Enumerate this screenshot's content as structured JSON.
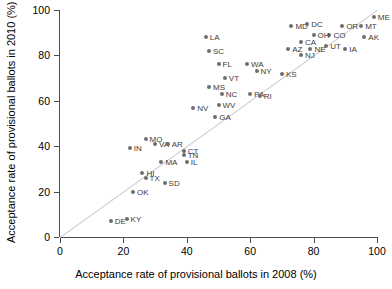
{
  "chart_data": {
    "type": "scatter",
    "title": "",
    "xlabel": "Acceptance rate of provisional ballots in 2008 (%)",
    "ylabel": "Acceptance rate of provisional ballots in 2010 (%)",
    "xlim": [
      0,
      100
    ],
    "ylim": [
      0,
      100
    ],
    "xticks": [
      0,
      20,
      40,
      60,
      80,
      100
    ],
    "yticks": [
      0,
      20,
      40,
      60,
      80,
      100
    ],
    "grid": false,
    "legend": "none",
    "annotations": [
      {
        "label": "reference-line",
        "description": "1:1 identity line y = x",
        "color": "#c8c8c8"
      }
    ],
    "point_color": "#6e6e6e",
    "points": [
      {
        "label": "LA",
        "x": 46,
        "y": 88,
        "label_side": "right"
      },
      {
        "label": "SC",
        "x": 47,
        "y": 82,
        "label_side": "right"
      },
      {
        "label": "MD",
        "x": 73,
        "y": 93,
        "label_side": "right"
      },
      {
        "label": "DC",
        "x": 78,
        "y": 94,
        "label_side": "right"
      },
      {
        "label": "ME",
        "x": 99,
        "y": 97,
        "label_side": "right"
      },
      {
        "label": "MT",
        "x": 95,
        "y": 93,
        "label_side": "right"
      },
      {
        "label": "OR",
        "x": 89,
        "y": 93,
        "label_side": "right"
      },
      {
        "label": "AK",
        "x": 96,
        "y": 88,
        "label_side": "right"
      },
      {
        "label": "CO",
        "x": 85,
        "y": 89,
        "label_side": "right"
      },
      {
        "label": "OH",
        "x": 80,
        "y": 89,
        "label_side": "right"
      },
      {
        "label": "CA",
        "x": 76,
        "y": 86,
        "label_side": "right"
      },
      {
        "label": "UT",
        "x": 84,
        "y": 84,
        "label_side": "right"
      },
      {
        "label": "NE",
        "x": 79,
        "y": 83,
        "label_side": "right"
      },
      {
        "label": "AZ",
        "x": 72,
        "y": 83,
        "label_side": "right"
      },
      {
        "label": "IA",
        "x": 90,
        "y": 83,
        "label_side": "right"
      },
      {
        "label": "NJ",
        "x": 76,
        "y": 80,
        "label_side": "right"
      },
      {
        "label": "WA",
        "x": 59,
        "y": 76,
        "label_side": "right"
      },
      {
        "label": "NY",
        "x": 62,
        "y": 73,
        "label_side": "right"
      },
      {
        "label": "FL",
        "x": 50,
        "y": 76,
        "label_side": "right"
      },
      {
        "label": "KS",
        "x": 70,
        "y": 72,
        "label_side": "right"
      },
      {
        "label": "VT",
        "x": 52,
        "y": 70,
        "label_side": "right"
      },
      {
        "label": "MS",
        "x": 47,
        "y": 66,
        "label_side": "right"
      },
      {
        "label": "NC",
        "x": 51,
        "y": 63,
        "label_side": "right"
      },
      {
        "label": "PA",
        "x": 60,
        "y": 63,
        "label_side": "right"
      },
      {
        "label": "RI",
        "x": 63,
        "y": 62,
        "label_side": "right"
      },
      {
        "label": "WV",
        "x": 50,
        "y": 58,
        "label_side": "right"
      },
      {
        "label": "NV",
        "x": 42,
        "y": 57,
        "label_side": "right"
      },
      {
        "label": "GA",
        "x": 49,
        "y": 53,
        "label_side": "right"
      },
      {
        "label": "MO",
        "x": 27,
        "y": 43,
        "label_side": "right"
      },
      {
        "label": "VA",
        "x": 30,
        "y": 41,
        "label_side": "right"
      },
      {
        "label": "AR",
        "x": 34,
        "y": 41,
        "label_side": "right"
      },
      {
        "label": "IN",
        "x": 22,
        "y": 39,
        "label_side": "right"
      },
      {
        "label": "CT",
        "x": 39,
        "y": 38,
        "label_side": "right"
      },
      {
        "label": "TN",
        "x": 39,
        "y": 36,
        "label_side": "right"
      },
      {
        "label": "MA",
        "x": 32,
        "y": 33,
        "label_side": "right"
      },
      {
        "label": "IL",
        "x": 40,
        "y": 33,
        "label_side": "right"
      },
      {
        "label": "HI",
        "x": 26,
        "y": 28,
        "label_side": "right"
      },
      {
        "label": "TX",
        "x": 27,
        "y": 26,
        "label_side": "right"
      },
      {
        "label": "SD",
        "x": 33,
        "y": 24,
        "label_side": "right"
      },
      {
        "label": "OK",
        "x": 23,
        "y": 20,
        "label_side": "right"
      },
      {
        "label": "DE",
        "x": 16,
        "y": 7,
        "label_side": "right"
      },
      {
        "label": "KY",
        "x": 21,
        "y": 8,
        "label_side": "right"
      }
    ]
  }
}
